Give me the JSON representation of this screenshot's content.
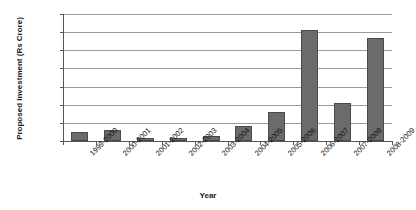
{
  "chart_data": {
    "type": "bar",
    "title": "",
    "xlabel": "Year",
    "ylabel": "Proposed Investment (Rs Crore)",
    "categories": [
      "1999-2000",
      "2000-2001",
      "2001-2002",
      "2002-2003",
      "2003-2004",
      "2004-2005",
      "2005-2006",
      "2006-2007",
      "2007-2008",
      "2008-2009"
    ],
    "values": [
      5000,
      6000,
      1500,
      1500,
      3000,
      8000,
      16000,
      61000,
      21000,
      57000
    ],
    "ylim": [
      0,
      70000
    ],
    "ytick_labels": [
      "70,000",
      "60,000",
      "50,000",
      "40,000",
      "30,000",
      "20,000",
      "10,000",
      "0"
    ],
    "ytick_values": [
      70000,
      60000,
      50000,
      40000,
      30000,
      20000,
      10000,
      0
    ],
    "grid": true,
    "legend": false,
    "bar_color": "#6b6b6b",
    "gridline_color": "#9a9a9a",
    "axis_color": "#555555",
    "background": "#ffffff"
  }
}
